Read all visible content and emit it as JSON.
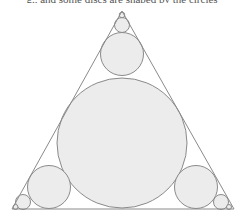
{
  "caption": "g., and some discs are shaped by the circles",
  "colors": {
    "stroke": "#8a8a8a",
    "fill": "#ececec",
    "background": "#ffffff"
  },
  "triangle": {
    "points": "122,11 12,209 234,209"
  },
  "circles": [
    {
      "name": "center-large-circle",
      "cx": 122,
      "cy": 143,
      "r": 65
    },
    {
      "name": "top-medium-circle",
      "cx": 122,
      "cy": 54,
      "r": 21.5
    },
    {
      "name": "top-small-circle",
      "cx": 122,
      "cy": 25,
      "r": 7.5
    },
    {
      "name": "bottom-left-medium-circle",
      "cx": 49,
      "cy": 187,
      "r": 21.5
    },
    {
      "name": "bottom-left-small-circle",
      "cx": 23,
      "cy": 202,
      "r": 7.5
    },
    {
      "name": "bottom-right-medium-circle",
      "cx": 196,
      "cy": 187,
      "r": 21.5
    },
    {
      "name": "bottom-right-small-circle",
      "cx": 221,
      "cy": 202,
      "r": 7.5
    },
    {
      "name": "top-tiny-circle",
      "cx": 122,
      "cy": 15,
      "r": 2.8
    },
    {
      "name": "bottom-left-tiny-circle",
      "cx": 15.5,
      "cy": 207,
      "r": 2.5
    },
    {
      "name": "bottom-right-tiny-circle",
      "cx": 229,
      "cy": 207,
      "r": 2.5
    }
  ]
}
